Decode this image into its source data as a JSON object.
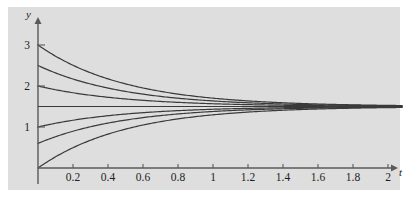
{
  "figure": {
    "background_color": "#ffffff",
    "panel_color": "#dedede",
    "curve_color": "#3a3a3a",
    "axis_color": "#5a5a5a"
  },
  "axes": {
    "y_axis_label": "y",
    "x_axis_label": "t",
    "x_ticks": [
      {
        "value": 0.2,
        "label": "0.2"
      },
      {
        "value": 0.4,
        "label": "0.4"
      },
      {
        "value": 0.6,
        "label": "0.6"
      },
      {
        "value": 0.8,
        "label": "0.8"
      },
      {
        "value": 1.0,
        "label": "1"
      },
      {
        "value": 1.2,
        "label": "1.2"
      },
      {
        "value": 1.4,
        "label": "1.4"
      },
      {
        "value": 1.6,
        "label": "1.6"
      },
      {
        "value": 1.8,
        "label": "1.8"
      },
      {
        "value": 2.0,
        "label": "2"
      }
    ],
    "y_ticks": [
      {
        "value": 1,
        "label": "1"
      },
      {
        "value": 2,
        "label": "2"
      },
      {
        "value": 3,
        "label": "3"
      }
    ]
  },
  "chart_data": {
    "type": "line",
    "title": "",
    "subtitle": "",
    "xlabel": "t",
    "ylabel": "y",
    "xlim": [
      0,
      2.1
    ],
    "ylim": [
      0,
      3.4
    ],
    "grid": false,
    "legend": "none",
    "equilibrium": 1.5,
    "decay_rate": 2.0,
    "annotations": [],
    "series": [
      {
        "name": "y0 = 3.0",
        "y0": 3.0,
        "values_at": {
          "0": 3.0,
          "0.5": 2.05,
          "1.0": 1.7,
          "1.5": 1.57,
          "2.0": 1.53
        }
      },
      {
        "name": "y0 = 2.5",
        "y0": 2.5,
        "values_at": {
          "0": 2.5,
          "0.5": 1.87,
          "1.0": 1.64,
          "1.5": 1.55,
          "2.0": 1.52
        }
      },
      {
        "name": "y0 = 2.0",
        "y0": 2.0,
        "values_at": {
          "0": 2.0,
          "0.5": 1.68,
          "1.0": 1.57,
          "1.5": 1.52,
          "2.0": 1.51
        }
      },
      {
        "name": "y0 = 1.5 (equilibrium)",
        "y0": 1.5,
        "values_at": {
          "0": 1.5,
          "0.5": 1.5,
          "1.0": 1.5,
          "1.5": 1.5,
          "2.0": 1.5
        }
      },
      {
        "name": "y0 = 1.0",
        "y0": 1.0,
        "values_at": {
          "0": 1.0,
          "0.5": 1.32,
          "1.0": 1.43,
          "1.5": 1.48,
          "2.0": 1.49
        }
      },
      {
        "name": "y0 = 0.6",
        "y0": 0.6,
        "values_at": {
          "0": 0.6,
          "0.5": 1.17,
          "1.0": 1.38,
          "1.5": 1.46,
          "2.0": 1.48
        }
      },
      {
        "name": "y0 = 0.0",
        "y0": 0.0,
        "values_at": {
          "0": 0.0,
          "0.5": 0.95,
          "1.0": 1.3,
          "1.5": 1.43,
          "2.0": 1.47
        }
      }
    ]
  }
}
